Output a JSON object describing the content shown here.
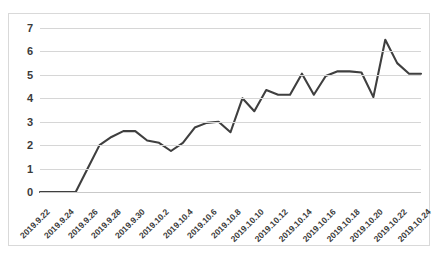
{
  "chart_data": {
    "type": "line",
    "title": "",
    "xlabel": "",
    "ylabel": "",
    "ylim": [
      0,
      7
    ],
    "yticks": [
      0,
      1,
      2,
      3,
      4,
      5,
      6,
      7
    ],
    "grid": true,
    "legend": "none",
    "line_color": "#3f3f3f",
    "xtick_labels": [
      "2019.9.22",
      "2019.9.24",
      "2019.9.26",
      "2019.9.28",
      "2019.9.30",
      "2019.10.2",
      "2019.10.4",
      "2019.10.6",
      "2019.10.8",
      "2019.10.10",
      "2019.10.12",
      "2019.10.14",
      "2019.10.16",
      "2019.10.18",
      "2019.10.20",
      "2019.10.22",
      "2019.10.24"
    ],
    "x": [
      "2019.9.22",
      "2019.9.23",
      "2019.9.24",
      "2019.9.25",
      "2019.9.26",
      "2019.9.27",
      "2019.9.28",
      "2019.9.29",
      "2019.9.30",
      "2019.10.1",
      "2019.10.2",
      "2019.10.3",
      "2019.10.4",
      "2019.10.5",
      "2019.10.6",
      "2019.10.7",
      "2019.10.8",
      "2019.10.9",
      "2019.10.10",
      "2019.10.11",
      "2019.10.12",
      "2019.10.13",
      "2019.10.14",
      "2019.10.15",
      "2019.10.16",
      "2019.10.17",
      "2019.10.18",
      "2019.10.19",
      "2019.10.20",
      "2019.10.21",
      "2019.10.22",
      "2019.10.23",
      "2019.10.24"
    ],
    "values": [
      0,
      0,
      0,
      0,
      1.0,
      2.0,
      2.35,
      2.6,
      2.6,
      2.2,
      2.1,
      1.75,
      2.1,
      2.75,
      2.95,
      3.0,
      2.55,
      4.0,
      3.45,
      4.35,
      4.15,
      4.15,
      5.05,
      4.15,
      4.95,
      5.15,
      5.15,
      5.1,
      4.05,
      6.5,
      5.5,
      5.05,
      5.05
    ]
  }
}
